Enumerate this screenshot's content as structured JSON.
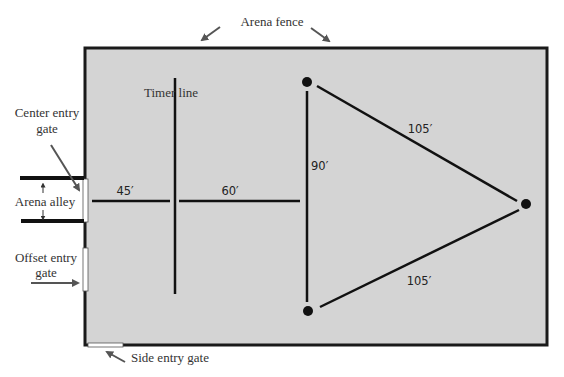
{
  "diagram": {
    "colors": {
      "arena_fill": "#d4d4d4",
      "fence": "#1a1a1a",
      "line": "#111111",
      "gate": "#ffffff",
      "arrow": "#555555",
      "label": "#333333"
    },
    "labels": {
      "arena_fence": "Arena fence",
      "timer_line": "Timer line",
      "center_entry_gate_line1": "Center entry",
      "center_entry_gate_line2": "gate",
      "arena_alley": "Arena alley",
      "offset_entry_gate_line1": "Offset entry",
      "offset_entry_gate_line2": "gate",
      "side_entry_gate": "Side entry gate"
    },
    "dimensions": {
      "gate_to_timer": "45′",
      "timer_to_barrels": "60′",
      "between_first_barrels": "90′",
      "barrel1_to_barrel3": "105′",
      "barrel2_to_barrel3": "105′"
    },
    "barrels": [
      {
        "name": "barrel-1",
        "position": "top-left"
      },
      {
        "name": "barrel-2",
        "position": "bottom-left"
      },
      {
        "name": "barrel-3",
        "position": "right"
      }
    ]
  }
}
